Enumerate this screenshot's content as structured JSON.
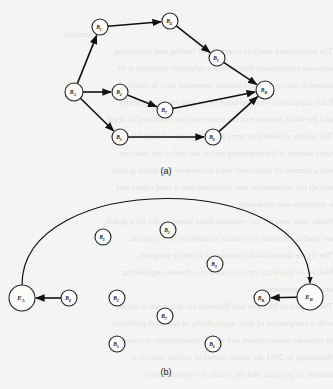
{
  "figure_a": {
    "caption": "(a)",
    "nodes": [
      {
        "id": "B1",
        "label": "B",
        "sub": "1",
        "x": 100,
        "y": 27,
        "r": 8
      },
      {
        "id": "B4",
        "label": "B",
        "sub": "4",
        "x": 170,
        "y": 21,
        "r": 8
      },
      {
        "id": "B5",
        "label": "B",
        "sub": "5",
        "x": 217,
        "y": 58,
        "r": 8
      },
      {
        "id": "BA",
        "label": "B",
        "sub": "A",
        "x": 74,
        "y": 92,
        "r": 9
      },
      {
        "id": "B2",
        "label": "B",
        "sub": "2",
        "x": 120,
        "y": 92,
        "r": 8
      },
      {
        "id": "B7",
        "label": "B",
        "sub": "7",
        "x": 165,
        "y": 110,
        "r": 8
      },
      {
        "id": "BB",
        "label": "B",
        "sub": "B",
        "x": 265,
        "y": 90,
        "r": 9
      },
      {
        "id": "B3",
        "label": "B",
        "sub": "3",
        "x": 120,
        "y": 137,
        "r": 8
      },
      {
        "id": "B6",
        "label": "B",
        "sub": "6",
        "x": 213,
        "y": 137,
        "r": 8
      }
    ],
    "edges": [
      [
        "BA",
        "B1"
      ],
      [
        "B1",
        "B4"
      ],
      [
        "B4",
        "B5"
      ],
      [
        "B5",
        "BB"
      ],
      [
        "BA",
        "B2"
      ],
      [
        "B2",
        "B7"
      ],
      [
        "B7",
        "BB"
      ],
      [
        "BA",
        "B3"
      ],
      [
        "B3",
        "B6"
      ],
      [
        "B6",
        "BB"
      ]
    ]
  },
  "figure_b": {
    "caption": "(b)",
    "nodes": [
      {
        "id": "EA",
        "label": "E",
        "sub": "A",
        "x": 22,
        "y": 298,
        "r": 13
      },
      {
        "id": "B4",
        "label": "B",
        "sub": "4",
        "x": 69,
        "y": 298,
        "r": 8
      },
      {
        "id": "B2",
        "label": "B",
        "sub": "2",
        "x": 117,
        "y": 298,
        "r": 8
      },
      {
        "id": "B1",
        "label": "B",
        "sub": "1",
        "x": 103,
        "y": 237,
        "r": 8
      },
      {
        "id": "B5",
        "label": "B",
        "sub": "5",
        "x": 168,
        "y": 230,
        "r": 8
      },
      {
        "id": "B3a",
        "label": "B",
        "sub": "3",
        "x": 215,
        "y": 264,
        "r": 8
      },
      {
        "id": "B7",
        "label": "B",
        "sub": "7",
        "x": 165,
        "y": 316,
        "r": 8
      },
      {
        "id": "B3",
        "label": "B",
        "sub": "3",
        "x": 117,
        "y": 344,
        "r": 8
      },
      {
        "id": "B6",
        "label": "B",
        "sub": "6",
        "x": 213,
        "y": 344,
        "r": 8
      },
      {
        "id": "BB",
        "label": "B",
        "sub": "B",
        "x": 262,
        "y": 298,
        "r": 8
      },
      {
        "id": "EB",
        "label": "E",
        "sub": "B",
        "x": 310,
        "y": 297,
        "r": 13
      }
    ],
    "edges": [
      [
        "B4",
        "EA"
      ],
      [
        "EB",
        "BB"
      ]
    ],
    "arc": {
      "from": "EA",
      "to": "EB"
    }
  },
  "bleed_text": [
    "ummary",
    "The preliminary analysis consisted of finding and comparing",
    "software components that were not originally intended to be",
    "reused in the system architecture presented here in detail.",
    "Each component was evaluated by its structural complexity",
    "and the block structure of the code was then examined in depth.",
    "The results showed that entry and exit points of each block",
    "were located at the beginning and at the end of the function,",
    "and a number of tools were used to compute the block graphs,",
    "and all the information was combined into a final report and",
    "a summary was produced.",
    "Many code metrics, for example those based on the flow graph,",
    "are used to measure the control complexity of a program.",
    "The figure shows block structure of a simple program.",
    "Metrics of this kind are often used in software engineering.",
    "and in maintenance.",
    "The metrics of McCabe and Halstead are discussed in detail,",
    "with a comparison of their applicability to practical problems",
    "in software measurement and in the classification of code.",
    "Beginning in 2001 the group started to collect data on a",
    "number of projects, and the results are reported here."
  ]
}
